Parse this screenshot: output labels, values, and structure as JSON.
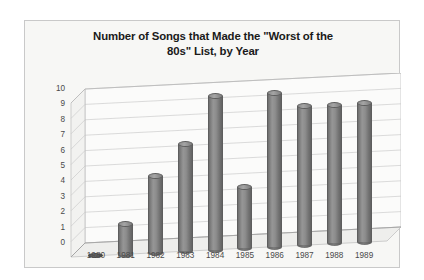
{
  "chart_data": {
    "type": "bar",
    "title": "Number of Songs that Made the \"Worst of the 80s\" List, by Year",
    "title_line1": "Number of Songs that Made the \"Worst of the",
    "title_line2": "80s\" List, by Year",
    "xlabel": "",
    "ylabel": "",
    "categories": [
      "1980",
      "1981",
      "1982",
      "1983",
      "1984",
      "1985",
      "1986",
      "1987",
      "1988",
      "1989"
    ],
    "values": [
      0,
      2,
      5,
      7,
      10,
      4,
      10,
      9,
      9,
      9
    ],
    "ylim": [
      0,
      10
    ],
    "ytick_labels": [
      "10",
      "9",
      "8",
      "7",
      "6",
      "5",
      "4",
      "3",
      "2",
      "1",
      "0"
    ],
    "ytick_values": [
      10,
      9,
      8,
      7,
      6,
      5,
      4,
      3,
      2,
      1,
      0
    ],
    "grid": true,
    "legend": false,
    "style": "3d-cylinder",
    "colors": {
      "bar": "#808080",
      "bar_dark": "#5e5e5e",
      "bar_light": "#a5a5a5",
      "plot_background": "#f7f7f5",
      "grid_line": "#b8b8b8",
      "frame_border": "#c9c9c9",
      "title_text": "#1a1a1a",
      "tick_text": "#4a4a4a"
    }
  }
}
